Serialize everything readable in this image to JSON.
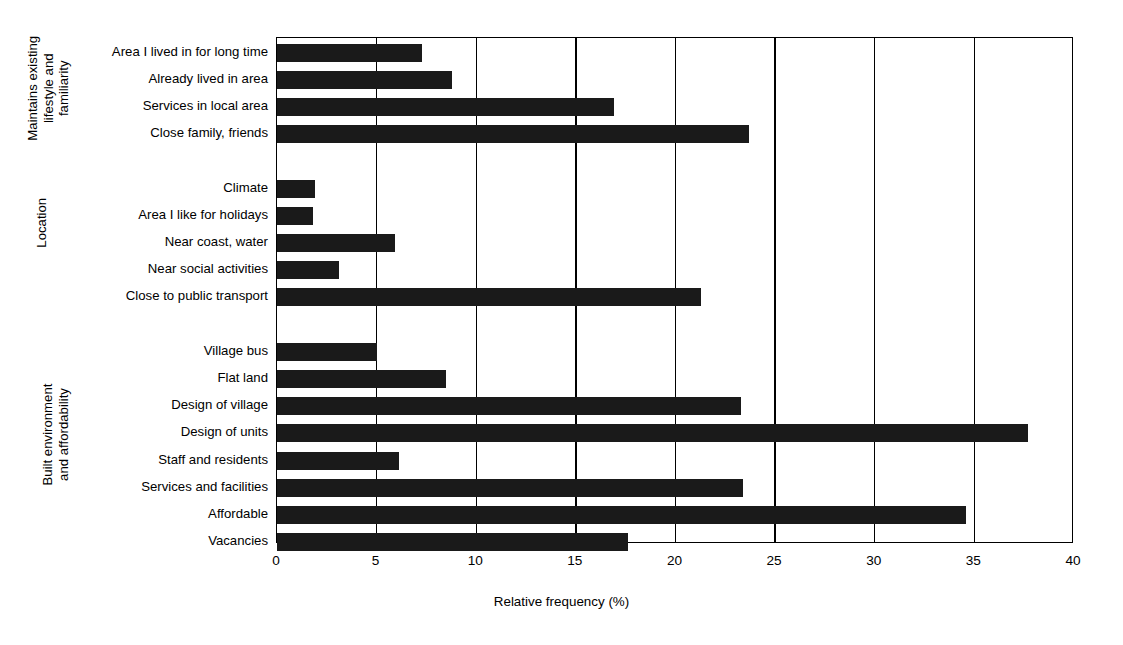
{
  "chart_data": {
    "type": "bar",
    "orientation": "horizontal",
    "title": "",
    "xlabel": "Relative frequency (%)",
    "ylabel": "",
    "xlim": [
      0,
      40
    ],
    "xticks": [
      0,
      5,
      10,
      15,
      20,
      25,
      30,
      35,
      40
    ],
    "grid": "vertical",
    "legend": "none",
    "bar_color": "#1a1a1a",
    "groups": [
      {
        "name": "Maintains existing lifestyle and familiarity",
        "label_lines": "Maintains existing\nlifestyle and\nfamiliarity",
        "categories": [
          "Area I lived in for long time",
          "Already lived in area",
          "Services in local area",
          "Close family, friends"
        ],
        "values": [
          7.3,
          8.8,
          16.9,
          23.7
        ]
      },
      {
        "name": "Location",
        "label_lines": "Location",
        "categories": [
          "Climate",
          "Area I like for holidays",
          "Near coast, water",
          "Near social activities",
          "Close to public transport"
        ],
        "values": [
          1.9,
          1.8,
          5.9,
          3.1,
          21.3
        ]
      },
      {
        "name": "Built environment and affordability",
        "label_lines": "Built environment\nand affordability",
        "categories": [
          "Village bus",
          "Flat land",
          "Design of village",
          "Design of units",
          "Staff and residents",
          "Services and facilities",
          "Affordable",
          "Vacancies"
        ],
        "values": [
          5.0,
          8.5,
          23.3,
          37.7,
          6.1,
          23.4,
          34.6,
          17.6
        ]
      }
    ],
    "categories": [
      "Area I lived in for long time",
      "Already lived in area",
      "Services in local area",
      "Close family, friends",
      "Climate",
      "Area I like for holidays",
      "Near coast, water",
      "Near social activities",
      "Close to public transport",
      "Village bus",
      "Flat land",
      "Design of village",
      "Design of units",
      "Staff and residents",
      "Services and facilities",
      "Affordable",
      "Vacancies"
    ],
    "values": [
      7.3,
      8.8,
      16.9,
      23.7,
      1.9,
      1.8,
      5.9,
      3.1,
      21.3,
      5.0,
      8.5,
      23.3,
      37.7,
      6.1,
      23.4,
      34.6,
      17.6
    ]
  }
}
